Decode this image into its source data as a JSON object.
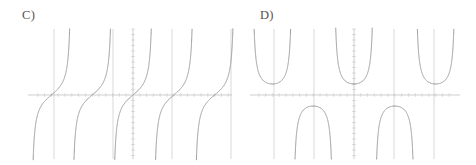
{
  "page": {
    "background_color": "#ffffff",
    "width": 476,
    "height": 165
  },
  "panels": [
    {
      "id": "c",
      "label": "C)",
      "label_x": 22,
      "label_y": 9
    },
    {
      "id": "d",
      "label": "D)",
      "label_x": 22,
      "label_y": 9
    }
  ],
  "style": {
    "curve_color": "#8e8e8e",
    "axis_color": "#b9b9b9",
    "asymptote_color": "#c9c9c9",
    "tick_color": "#cfcfcf",
    "label_color": "#55514f",
    "curve_width": 0.9,
    "axis_width": 0.7,
    "asymptote_width": 0.7
  },
  "chart_data": [
    {
      "type": "line",
      "id": "graph-c",
      "title": "C)",
      "function": "tan",
      "description": "Tangent-like periodic curve: each branch increases from negative infinity to positive infinity between consecutive vertical asymptotes, with an inflection point where it crosses the x-axis.",
      "xlabel": "",
      "ylabel": "",
      "grid": false,
      "legend": null,
      "xlim": [
        -7.85,
        7.85
      ],
      "ylim": [
        -6.0,
        6.0
      ],
      "period": 3.1416,
      "x_axis_y": 0,
      "y_axis_x": 0,
      "asymptotes_x": [
        -4.712,
        -1.571,
        1.571,
        4.712
      ],
      "zeros_x": [
        -6.283,
        -3.1416,
        0,
        3.1416,
        6.283
      ],
      "tick_spacing_x": 0.5236,
      "tick_spacing_y": 0.5,
      "pixel_geometry": {
        "plot_left": 28,
        "plot_right": 232,
        "plot_top": 29,
        "plot_bottom": 159,
        "x_axis_pixel_y": 95,
        "y_axis_pixel_x": 133,
        "asymptote_pixel_x": [
          54,
          113,
          172,
          231
        ],
        "branch_zero_pixel_x": [
          25,
          84,
          143,
          202
        ],
        "px_per_unit_x": 12.99,
        "px_per_unit_y": 11.0
      }
    },
    {
      "type": "line",
      "id": "graph-d",
      "title": "D)",
      "function": "sec",
      "description": "Secant-like periodic curve: U-shaped branches opening upward with minimum value 1 above the x-axis, alternating with inverted cap-shaped branches with maximum value -1 below the x-axis, separated by vertical asymptotes.",
      "xlabel": "",
      "ylabel": "",
      "grid": false,
      "legend": null,
      "xlim": [
        -7.85,
        7.85
      ],
      "ylim": [
        -6.0,
        6.0
      ],
      "period": 6.2832,
      "x_axis_y": 0,
      "y_axis_x": 0,
      "asymptotes_x": [
        -4.712,
        -1.571,
        1.571,
        4.712
      ],
      "minima": [
        {
          "x": 0,
          "y": 1
        },
        {
          "x": -6.283,
          "y": 1
        },
        {
          "x": 6.283,
          "y": 1
        }
      ],
      "maxima": [
        {
          "x": -3.1416,
          "y": -1
        },
        {
          "x": 3.1416,
          "y": -1
        }
      ],
      "tick_spacing_x": 0.5236,
      "tick_spacing_y": 0.5,
      "pixel_geometry": {
        "plot_left": 12,
        "plot_right": 222,
        "plot_top": 29,
        "plot_bottom": 159,
        "x_axis_pixel_y": 95,
        "y_axis_pixel_x": 116,
        "asymptote_pixel_x": [
          36,
          76,
          156,
          196
        ],
        "px_per_unit_x": 12.99,
        "px_per_unit_y": 11.0
      }
    }
  ]
}
